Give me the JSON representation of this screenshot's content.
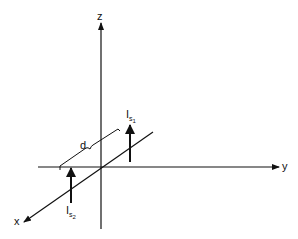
{
  "diagram": {
    "type": "3d-axes-current-sources",
    "axes": {
      "x_label": "x",
      "y_label": "y",
      "z_label": "z"
    },
    "distance_label": "d",
    "sources": [
      {
        "name": "I_s1",
        "main": "I",
        "sub": "s",
        "subsub": "1",
        "direction": "up (+z)"
      },
      {
        "name": "I_s2",
        "main": "I",
        "sub": "s",
        "subsub": "2",
        "direction": "up (+z)"
      }
    ]
  }
}
